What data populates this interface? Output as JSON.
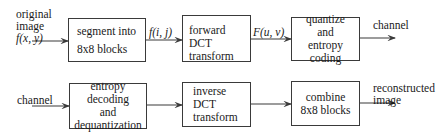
{
  "diagram": {
    "encoder": {
      "input_label": [
        "original",
        "image",
        "f(x, y)"
      ],
      "blocks": [
        {
          "id": "segment",
          "lines": [
            "segment into",
            "8x8 blocks"
          ]
        },
        {
          "id": "forward_dct",
          "lines": [
            "forward DCT",
            "transform"
          ]
        },
        {
          "id": "quantize",
          "lines": [
            "quantize",
            "and",
            "entropy coding"
          ]
        }
      ],
      "edge_labels": {
        "segment_to_dct": "f(i, j)",
        "dct_to_quantize": "F(u, v)"
      },
      "output_label": "channel"
    },
    "decoder": {
      "input_label": "channel",
      "blocks": [
        {
          "id": "entropy_decoding",
          "lines": [
            "entropy decoding",
            "and",
            "dequantization"
          ]
        },
        {
          "id": "inverse_dct",
          "lines": [
            "inverse DCT",
            "transform"
          ]
        },
        {
          "id": "combine",
          "lines": [
            "combine",
            "8x8 blocks"
          ]
        }
      ],
      "output_label": [
        "reconstructed",
        "image"
      ]
    },
    "colors": {
      "line": "#3a3a3a",
      "text": "#1a1a1a",
      "background": "#ffffff"
    }
  }
}
